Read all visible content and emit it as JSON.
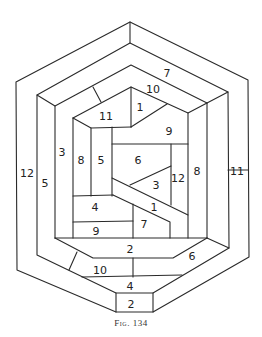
{
  "figure": {
    "caption": "Fig. 134",
    "line_color": "#2a2a2a",
    "background": "#ffffff"
  },
  "pieces": [
    {
      "id": "outer-left",
      "label": "12",
      "x": 27,
      "y": 173
    },
    {
      "id": "outer-right",
      "label": "11",
      "x": 237,
      "y": 171
    },
    {
      "id": "ring2-top",
      "label": "7",
      "x": 167,
      "y": 73
    },
    {
      "id": "ring2-left",
      "label": "5",
      "x": 45,
      "y": 183
    },
    {
      "id": "ring3-top",
      "label": "10",
      "x": 153,
      "y": 89
    },
    {
      "id": "ring3-left",
      "label": "3",
      "x": 62,
      "y": 152
    },
    {
      "id": "ring3-right",
      "label": "8",
      "x": 197,
      "y": 171
    },
    {
      "id": "inner-top-left",
      "label": "11",
      "x": 106,
      "y": 116
    },
    {
      "id": "inner-top-mid",
      "label": "1",
      "x": 140,
      "y": 107
    },
    {
      "id": "inner-top-right",
      "label": "9",
      "x": 169,
      "y": 131
    },
    {
      "id": "inner-left-col",
      "label": "8",
      "x": 81,
      "y": 160
    },
    {
      "id": "inner-mid-col",
      "label": "5",
      "x": 101,
      "y": 160
    },
    {
      "id": "inner-center",
      "label": "6",
      "x": 138,
      "y": 160
    },
    {
      "id": "inner-right-col",
      "label": "12",
      "x": 178,
      "y": 178
    },
    {
      "id": "inner-triangle",
      "label": "3",
      "x": 156,
      "y": 185
    },
    {
      "id": "inner-band",
      "label": "1",
      "x": 154,
      "y": 207
    },
    {
      "id": "inner-lower-left",
      "label": "4",
      "x": 95,
      "y": 207
    },
    {
      "id": "inner-lower-mid",
      "label": "7",
      "x": 144,
      "y": 224
    },
    {
      "id": "inner-bottom-left",
      "label": "9",
      "x": 96,
      "y": 231
    },
    {
      "id": "ring3-bottom",
      "label": "2",
      "x": 130,
      "y": 249
    },
    {
      "id": "ring2-bottom-right",
      "label": "6",
      "x": 192,
      "y": 256
    },
    {
      "id": "ring2-bottom-left",
      "label": "10",
      "x": 100,
      "y": 270
    },
    {
      "id": "ring1-bottom",
      "label": "4",
      "x": 130,
      "y": 286
    },
    {
      "id": "outer-bottom",
      "label": "2",
      "x": 131,
      "y": 304
    }
  ]
}
